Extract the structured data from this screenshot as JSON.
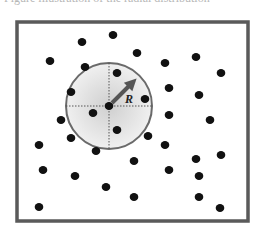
{
  "caption": {
    "text": "Figure illustration of the radial distribution"
  },
  "diagram": {
    "frame": {
      "x": 17,
      "y": 22,
      "width": 231,
      "height": 199,
      "stroke": "#5a5a5a"
    },
    "circle": {
      "cx": 109,
      "cy": 106,
      "r": 43,
      "fill_inner": "#d8d8d8",
      "fill_outer": "#f2f2f2",
      "stroke": "#6a6a6a"
    },
    "radius_label": "R",
    "dot_color": "#111111",
    "dots": [
      [
        113,
        35
      ],
      [
        82,
        42
      ],
      [
        50,
        61
      ],
      [
        85,
        67
      ],
      [
        117,
        73
      ],
      [
        71,
        92
      ],
      [
        93,
        113
      ],
      [
        61,
        120
      ],
      [
        137,
        53
      ],
      [
        165,
        63
      ],
      [
        196,
        57
      ],
      [
        221,
        73
      ],
      [
        169,
        88
      ],
      [
        145,
        99
      ],
      [
        199,
        95
      ],
      [
        169,
        115
      ],
      [
        210,
        120
      ],
      [
        117,
        130
      ],
      [
        71,
        138
      ],
      [
        39,
        145
      ],
      [
        96,
        151
      ],
      [
        43,
        170
      ],
      [
        75,
        176
      ],
      [
        106,
        187
      ],
      [
        39,
        207
      ],
      [
        148,
        136
      ],
      [
        165,
        145
      ],
      [
        221,
        155
      ],
      [
        134,
        161
      ],
      [
        196,
        159
      ],
      [
        169,
        170
      ],
      [
        199,
        176
      ],
      [
        134,
        197
      ],
      [
        199,
        197
      ],
      [
        220,
        208
      ]
    ]
  }
}
